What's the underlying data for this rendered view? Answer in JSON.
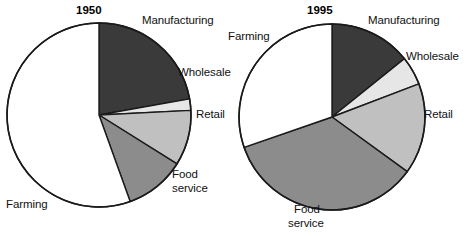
{
  "chart_data": [
    {
      "type": "pie",
      "title": "1950",
      "categories": [
        "Manufacturing",
        "Wholesale",
        "Retail",
        "Food service",
        "Farming"
      ],
      "values": [
        22.2,
        2.0,
        9.7,
        10.6,
        55.5
      ],
      "unit": "percent",
      "start_angle_deg": 0,
      "direction": "clockwise",
      "colors": [
        "#3a3a3a",
        "#e6e6e6",
        "#c0c0c0",
        "#8c8c8c",
        "#ffffff"
      ],
      "labels_outside": true,
      "legend": "none"
    },
    {
      "type": "pie",
      "title": "1995",
      "categories": [
        "Manufacturing",
        "Wholesale",
        "Retail",
        "Food service",
        "Farming"
      ],
      "values": [
        14.2,
        5.0,
        15.8,
        34.7,
        30.3
      ],
      "unit": "percent",
      "start_angle_deg": 0,
      "direction": "clockwise",
      "colors": [
        "#3a3a3a",
        "#e6e6e6",
        "#c0c0c0",
        "#8c8c8c",
        "#ffffff"
      ],
      "labels_outside": true,
      "legend": "none"
    }
  ],
  "chart_left": {
    "title": "1950",
    "labels": {
      "manufacturing": "Manufacturing",
      "wholesale": "Wholesale",
      "retail": "Retail",
      "food_service_line1": "Food",
      "food_service_line2": "service",
      "farming": "Farming"
    }
  },
  "chart_right": {
    "title": "1995",
    "labels": {
      "manufacturing": "Manufacturing",
      "wholesale": "Wholesale",
      "retail": "Retail",
      "food_service_line1": "Food",
      "food_service_line2": "service",
      "farming": "Farming"
    }
  },
  "colors": {
    "manufacturing": "#3a3a3a",
    "wholesale": "#e6e6e6",
    "retail": "#c0c0c0",
    "food_service": "#8c8c8c",
    "farming": "#ffffff",
    "outline": "#1a1a1a",
    "text": "#111111",
    "background": "#ffffff"
  }
}
